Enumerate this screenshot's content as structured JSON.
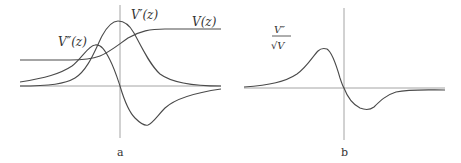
{
  "panels": [
    {
      "id": "a",
      "caption": "a",
      "curves": [
        {
          "name": "V(z)",
          "label": "V(z)",
          "shape": "sigmoid rising step"
        },
        {
          "name": "V'(z)",
          "label": "V′(z)",
          "shape": "single positive peak centered at z=0"
        },
        {
          "name": "V''(z)",
          "label": "V″(z)",
          "shape": "positive lobe left of z=0, negative lobe right of z=0"
        }
      ]
    },
    {
      "id": "b",
      "caption": "b",
      "curves": [
        {
          "name": "V''/sqrt(V)",
          "label_num": "V″",
          "label_den": "√V",
          "shape": "positive lobe left, smaller negative lobe right"
        }
      ]
    }
  ],
  "colors": {
    "axis": "#9a9a9a",
    "curve": "#4a4a4a",
    "text": "#333333"
  }
}
